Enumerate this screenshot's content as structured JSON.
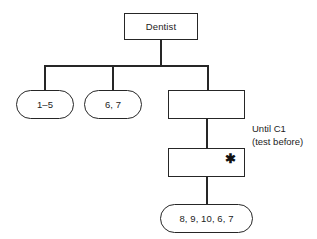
{
  "diagram": {
    "type": "hierarchical-task-analysis-tree",
    "root": {
      "id": "dentist",
      "label": "Dentist",
      "shape": "rectangle"
    },
    "children": [
      {
        "id": "1-5",
        "label": "1–5",
        "shape": "pill"
      },
      {
        "id": "6-7",
        "label": "6, 7",
        "shape": "pill"
      },
      {
        "id": "task-a",
        "label": "",
        "shape": "rectangle"
      }
    ],
    "chain": [
      {
        "id": "task-b",
        "label": "",
        "shape": "rectangle",
        "marker": "✱"
      },
      {
        "id": "leaf-list",
        "label": "8, 9, 10, 6, 7",
        "shape": "pill"
      }
    ],
    "annotation": {
      "line1": "Until C1",
      "line2": "(test before)"
    },
    "style": {
      "stroke": "#262626",
      "fill": "#ffffff",
      "text": "#1c1c1c",
      "background": "#ffffff"
    }
  }
}
